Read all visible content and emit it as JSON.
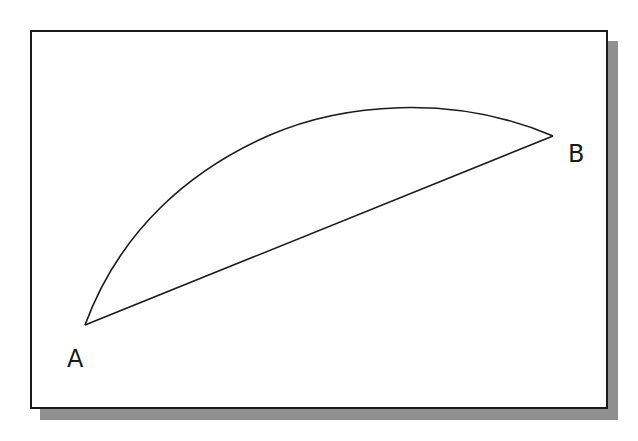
{
  "diagram": {
    "colors": {
      "stroke": "#1a1a1a",
      "frame_border": "#1a1a1a",
      "shadow": "#8f8f8f",
      "background": "#ffffff"
    },
    "points": [
      {
        "id": "A",
        "label": "A",
        "x": 85,
        "y": 325,
        "label_x": 67,
        "label_y": 367
      },
      {
        "id": "B",
        "label": "B",
        "x": 553,
        "y": 136,
        "label_x": 568,
        "label_y": 162
      }
    ],
    "curve": {
      "from": "A",
      "to": "B",
      "path": "M85,325 C120,230 190,170 270,135 C340,105 450,92 553,136"
    },
    "line": {
      "from": "A",
      "to": "B"
    }
  }
}
